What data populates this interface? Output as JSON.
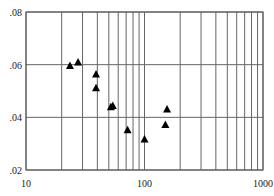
{
  "chart_data": {
    "type": "scatter",
    "title": "",
    "xlabel": "",
    "ylabel": "",
    "xscale": "log",
    "xlim": [
      10,
      1000
    ],
    "ylim": [
      0.02,
      0.08
    ],
    "grid": true,
    "x_ticks": [
      10,
      100,
      1000
    ],
    "x_tick_labels": [
      "10",
      "100",
      "1000"
    ],
    "y_ticks": [
      0.02,
      0.04,
      0.06,
      0.08
    ],
    "y_tick_labels": [
      ".02",
      ".04",
      ".06",
      ".08"
    ],
    "marker": "triangle",
    "marker_color": "#000000",
    "series": [
      {
        "name": "data",
        "points": [
          {
            "x": 23.5,
            "y": 0.0597
          },
          {
            "x": 27.5,
            "y": 0.061
          },
          {
            "x": 39,
            "y": 0.0565
          },
          {
            "x": 39,
            "y": 0.0512
          },
          {
            "x": 52,
            "y": 0.044
          },
          {
            "x": 54,
            "y": 0.0445
          },
          {
            "x": 72,
            "y": 0.0353
          },
          {
            "x": 100,
            "y": 0.0318
          },
          {
            "x": 155,
            "y": 0.0432
          },
          {
            "x": 150,
            "y": 0.0373
          }
        ]
      }
    ]
  }
}
